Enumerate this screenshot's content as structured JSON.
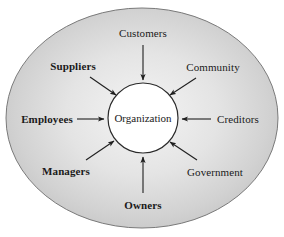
{
  "diagram": {
    "type": "stakeholder-model",
    "center": {
      "label": "Organization",
      "shape": "circle",
      "cx": 143,
      "cy": 118,
      "r": 35,
      "fill": "#ffffff",
      "stroke": "#2b2b2b",
      "font_size": 11
    },
    "boundary": {
      "shape": "ellipse",
      "name": "environment-ellipse",
      "cx": 142,
      "cy": 118,
      "rx": 136,
      "ry": 110,
      "fill_center": "#f2f2f2",
      "fill_edge": "#c2c2c2",
      "stroke": "#7a7a7a"
    },
    "stakeholders": [
      {
        "id": "customers",
        "label": "Customers",
        "bold": false,
        "label_x": 143,
        "label_y": 33,
        "font_size": 11,
        "arrow": {
          "x1": 143,
          "y1": 45,
          "x2": 143,
          "y2": 80
        }
      },
      {
        "id": "community",
        "label": "Community",
        "bold": false,
        "label_x": 213,
        "label_y": 67,
        "font_size": 11,
        "arrow": {
          "x1": 196,
          "y1": 78,
          "x2": 170,
          "y2": 95
        }
      },
      {
        "id": "creditors",
        "label": "Creditors",
        "bold": false,
        "label_x": 238,
        "label_y": 119,
        "font_size": 11,
        "arrow": {
          "x1": 211,
          "y1": 119,
          "x2": 182,
          "y2": 119
        }
      },
      {
        "id": "government",
        "label": "Government",
        "bold": false,
        "label_x": 215,
        "label_y": 172,
        "font_size": 11,
        "arrow": {
          "x1": 197,
          "y1": 160,
          "x2": 170,
          "y2": 142
        }
      },
      {
        "id": "owners",
        "label": "Owners",
        "bold": true,
        "label_x": 143,
        "label_y": 205,
        "font_size": 11,
        "arrow": {
          "x1": 143,
          "y1": 193,
          "x2": 143,
          "y2": 157
        }
      },
      {
        "id": "managers",
        "label": "Managers",
        "bold": true,
        "label_x": 66,
        "label_y": 171,
        "font_size": 11,
        "arrow": {
          "x1": 86,
          "y1": 160,
          "x2": 114,
          "y2": 141
        }
      },
      {
        "id": "employees",
        "label": "Employees",
        "bold": true,
        "label_x": 47,
        "label_y": 119,
        "font_size": 11,
        "arrow": {
          "x1": 77,
          "y1": 119,
          "x2": 104,
          "y2": 119
        }
      },
      {
        "id": "suppliers",
        "label": "Suppliers",
        "bold": true,
        "label_x": 73,
        "label_y": 66,
        "font_size": 11,
        "arrow": {
          "x1": 90,
          "y1": 77,
          "x2": 116,
          "y2": 95
        }
      }
    ]
  }
}
